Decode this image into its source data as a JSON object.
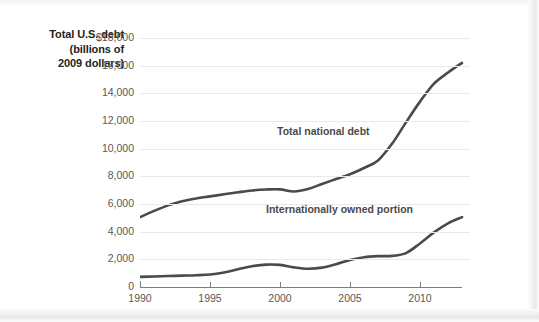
{
  "axis_title": {
    "line1": "Total U.S. debt",
    "line2": "(billions of",
    "line3": "2009 dollars)"
  },
  "chart_data": {
    "type": "line",
    "title": "Total U.S. debt (billions of 2009 dollars)",
    "xlabel": "",
    "ylabel": "Total U.S. debt (billions of 2009 dollars)",
    "xlim": [
      1990,
      2013
    ],
    "ylim": [
      0,
      18000
    ],
    "grid": true,
    "legend_position": "inline-annotation",
    "x_ticks": [
      1990,
      1995,
      2000,
      2005,
      2010
    ],
    "x_tick_labels": [
      "1990",
      "1995",
      "2000",
      "2005",
      "2010"
    ],
    "y_ticks": [
      0,
      2000,
      4000,
      6000,
      8000,
      10000,
      12000,
      14000,
      16000,
      18000
    ],
    "y_tick_labels": [
      "0",
      "2,000",
      "4,000",
      "6,000",
      "8,000",
      "10,000",
      "12,000",
      "14,000",
      "16,000",
      "$18,000"
    ],
    "x": [
      1990,
      1991,
      1992,
      1993,
      1994,
      1995,
      1996,
      1997,
      1998,
      1999,
      2000,
      2001,
      2002,
      2003,
      2004,
      2005,
      2006,
      2007,
      2008,
      2009,
      2010,
      2011,
      2012,
      2013
    ],
    "series": [
      {
        "name": "Total national debt",
        "color": "#4a4a4c",
        "values": [
          5050,
          5500,
          5900,
          6200,
          6400,
          6550,
          6700,
          6850,
          6980,
          7050,
          7060,
          6900,
          7080,
          7450,
          7800,
          8150,
          8600,
          9150,
          10350,
          11900,
          13400,
          14700,
          15500,
          16200
        ]
      },
      {
        "name": "Internationally owned portion",
        "color": "#4a4a4c",
        "values": [
          730,
          760,
          790,
          820,
          850,
          900,
          1050,
          1280,
          1500,
          1620,
          1600,
          1420,
          1320,
          1400,
          1650,
          1950,
          2150,
          2230,
          2250,
          2450,
          3150,
          3950,
          4600,
          5050
        ]
      }
    ],
    "annotations": [
      {
        "text": "Total national debt",
        "x": 2004.4,
        "y": 10750
      },
      {
        "text": "Internationally owned portion",
        "x": 2003.6,
        "y": 5400
      }
    ]
  }
}
